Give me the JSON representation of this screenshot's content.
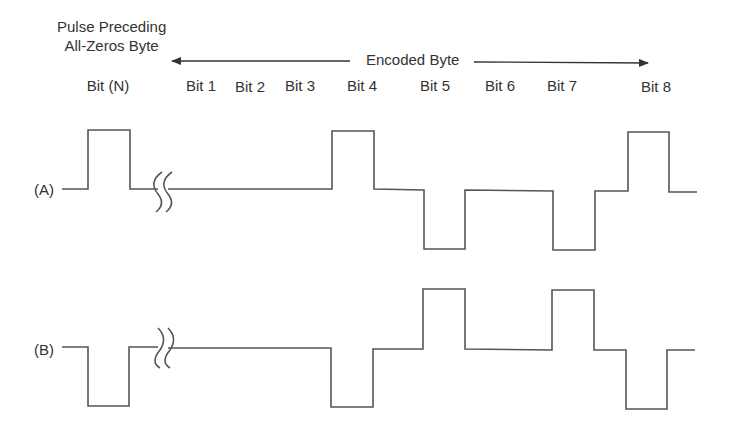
{
  "annotations": {
    "preceding_line1": "Pulse Preceding",
    "preceding_line2": "All-Zeros Byte",
    "encoded_byte": "Encoded Byte"
  },
  "bit_labels": [
    {
      "text": "Bit (N)",
      "x": 108,
      "y": 77
    },
    {
      "text": "Bit 1",
      "x": 201,
      "y": 77
    },
    {
      "text": "Bit 2",
      "x": 250,
      "y": 78
    },
    {
      "text": "Bit 3",
      "x": 300,
      "y": 77
    },
    {
      "text": "Bit 4",
      "x": 362,
      "y": 77
    },
    {
      "text": "Bit 5",
      "x": 435,
      "y": 77
    },
    {
      "text": "Bit 6",
      "x": 500,
      "y": 77
    },
    {
      "text": "Bit 7",
      "x": 562,
      "y": 77
    },
    {
      "text": "Bit 8",
      "x": 656,
      "y": 78
    }
  ],
  "signals": [
    {
      "label": "(A)",
      "label_x": 34,
      "label_y": 181
    },
    {
      "label": "(B)",
      "label_x": 34,
      "label_y": 341
    }
  ],
  "style": {
    "line_color": "#555555",
    "text_color": "#333333"
  }
}
